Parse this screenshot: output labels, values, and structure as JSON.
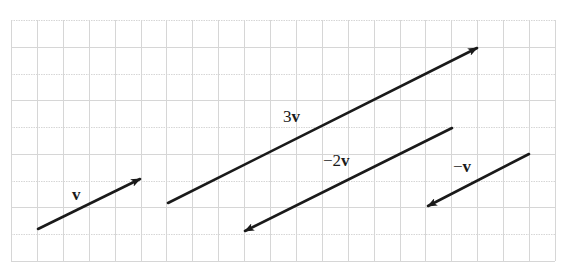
{
  "figure": {
    "grid": {
      "left": 11,
      "top": 20,
      "right": 555,
      "bottom": 261,
      "columns": 21,
      "rows": 9,
      "line_color": "#d6d6d6"
    },
    "arrow_color": "#1a1a1a",
    "vectors": [
      {
        "id": "v",
        "label_coef": "",
        "label_sym": "v",
        "components": [
          4,
          2
        ],
        "tail": [
          38,
          229
        ],
        "head": [
          140,
          179
        ],
        "label_pos": [
          72,
          186
        ]
      },
      {
        "id": "3v",
        "label_coef": "3",
        "label_sym": "v",
        "components": [
          12,
          6
        ],
        "tail": [
          168,
          203
        ],
        "head": [
          477,
          48
        ],
        "label_pos": [
          283,
          108
        ]
      },
      {
        "id": "neg2v",
        "label_coef": "−2",
        "label_sym": "v",
        "components": [
          -8,
          -4
        ],
        "tail": [
          452,
          128
        ],
        "head": [
          245,
          231
        ],
        "label_pos": [
          323,
          152
        ]
      },
      {
        "id": "negv",
        "label_coef": "−",
        "label_sym": "v",
        "components": [
          -4,
          -2
        ],
        "tail": [
          529,
          154
        ],
        "head": [
          428,
          206
        ],
        "label_pos": [
          453,
          158
        ]
      }
    ]
  }
}
